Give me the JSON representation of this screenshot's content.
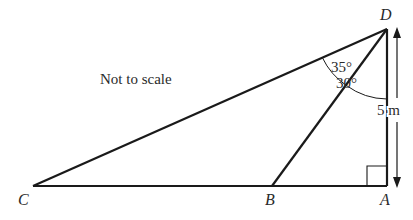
{
  "diagram": {
    "note": "Not to scale",
    "points": {
      "C": "C",
      "B": "B",
      "A": "A",
      "D": "D"
    },
    "angles": {
      "CDB": "35°",
      "BDA": "30°"
    },
    "measurements": {
      "DA": "5 m"
    },
    "right_angle_at": "A"
  }
}
